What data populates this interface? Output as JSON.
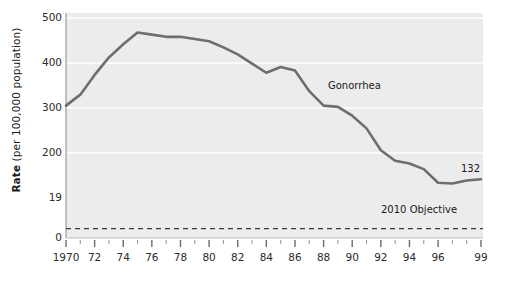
{
  "chart_data": {
    "type": "line",
    "title": "",
    "xlabel": "",
    "ylabel": "Rate (per 100,000 population)",
    "ylabel_bold_prefix": "Rate",
    "ylabel_rest": " (per 100,000 population)",
    "grid": true,
    "legend_position": "inline-annotation",
    "xlim": [
      1970,
      1999
    ],
    "ylim": [
      0,
      500
    ],
    "y_ticks": [
      0,
      19,
      200,
      300,
      400,
      500
    ],
    "y_tick_labels": [
      "0",
      "19",
      "200",
      "300",
      "400",
      "500"
    ],
    "x_ticks": [
      1970,
      1972,
      1974,
      1976,
      1978,
      1980,
      1982,
      1984,
      1986,
      1988,
      1990,
      1992,
      1994,
      1996,
      1999
    ],
    "x_tick_labels": [
      "1970",
      "72",
      "74",
      "76",
      "78",
      "80",
      "82",
      "84",
      "86",
      "88",
      "90",
      "92",
      "94",
      "96",
      "99"
    ],
    "x_minor_ticks": [
      1971,
      1973,
      1975,
      1977,
      1979,
      1981,
      1983,
      1985,
      1987,
      1989,
      1991,
      1993,
      1995,
      1997,
      1998
    ],
    "series": [
      {
        "name": "Gonorrhea",
        "color": "#6e6e6e",
        "x": [
          1970,
          1971,
          1972,
          1973,
          1974,
          1975,
          1976,
          1977,
          1978,
          1979,
          1980,
          1981,
          1982,
          1983,
          1984,
          1985,
          1986,
          1987,
          1988,
          1989,
          1990,
          1991,
          1992,
          1993,
          1994,
          1995,
          1996,
          1997,
          1998,
          1999
        ],
        "values": [
          300,
          325,
          370,
          410,
          440,
          467,
          462,
          457,
          457,
          452,
          447,
          433,
          417,
          396,
          375,
          388,
          380,
          333,
          300,
          297,
          277,
          248,
          198,
          174,
          168,
          155,
          124,
          122,
          129,
          132
        ]
      }
    ],
    "reference_lines": [
      {
        "name": "2010 Objective",
        "value": 19,
        "style": "dashed",
        "color": "#3a3a3a",
        "label": "2010 Objective"
      }
    ],
    "annotations": [
      {
        "name": "series-label",
        "text": "Gonorrhea",
        "x": 1986.5,
        "y": 340
      },
      {
        "name": "endpoint-value",
        "text": "132",
        "x": 1998.4,
        "y": 168
      },
      {
        "name": "objective-label",
        "text": "2010 Objective",
        "x": 1995.2,
        "y": -25
      }
    ],
    "colors": {
      "plot_background": "#ececec",
      "gridline": "#ffffff",
      "line": "#6e6e6e",
      "axis": "#8a8a8a",
      "text": "#2b2b2b",
      "page_background": "#ffffff"
    }
  },
  "annotations_text": {
    "series_label": "Gonorrhea",
    "endpoint_value": "132",
    "objective_label": "2010 Objective"
  },
  "y_axis": {
    "title_bold": "Rate",
    "title_rest": " (per 100,000 population)",
    "labels": {
      "t500": "500",
      "t400": "400",
      "t300": "300",
      "t200": "200",
      "t19": "19",
      "t0": "0"
    }
  },
  "x_axis": {
    "labels": [
      "1970",
      "72",
      "74",
      "76",
      "78",
      "80",
      "82",
      "84",
      "86",
      "88",
      "90",
      "92",
      "94",
      "96",
      "99"
    ]
  }
}
